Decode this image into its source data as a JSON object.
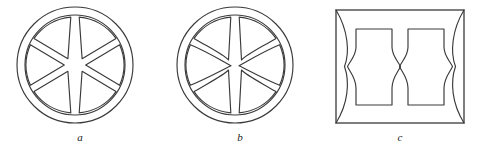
{
  "plate": {
    "background_color": "#ffffff",
    "ink_color": "#3a3a3a",
    "figure_count": 3
  },
  "figures": [
    {
      "id": "a",
      "caption": "a",
      "shape": "circle-six-sector-wheel",
      "description": "Ring-bounded disc divided into six sectors by straight gap bands; two straight diagonal bands cross at the centre forming an X",
      "spoke_style": "straight",
      "sector_count": 6,
      "outer_radius": 58,
      "inner_radius": 50,
      "center_x": 75,
      "center_y": 65
    },
    {
      "id": "b",
      "caption": "b",
      "shape": "circle-six-sector-wheel-pinched",
      "description": "Ring-bounded disc divided into six sectors; the diagonal gap bands are curved and pinch together at the centre forming a bowtie",
      "spoke_style": "curved-pinched",
      "sector_count": 6,
      "outer_radius": 58,
      "inner_radius": 50,
      "center_x": 75,
      "center_y": 65
    },
    {
      "id": "c",
      "caption": "c",
      "shape": "rectangle-with-two-waisted-blocks",
      "description": "Outer rectangle frame enclosing two waisted rectangular blocks whose sides curve inward and pinch at mid height",
      "block_count": 2,
      "frame_left": 16,
      "frame_top": 10,
      "frame_width": 128,
      "frame_height": 113
    }
  ],
  "captions": {
    "a": "a",
    "b": "b",
    "c": "c"
  }
}
